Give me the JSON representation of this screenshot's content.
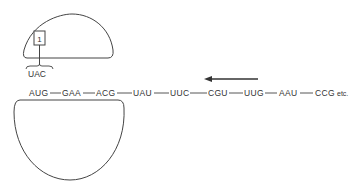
{
  "diagram": {
    "type": "ribosome-translation-schematic",
    "mrna": {
      "codons": [
        "AUG",
        "GAA",
        "ACG",
        "UAU",
        "UUC",
        "CGU",
        "UUG",
        "AAU",
        "CCG"
      ],
      "suffix": "etc."
    },
    "trna": {
      "number_label": "1",
      "anticodon": "UAC"
    },
    "arrow": {
      "direction": "left"
    },
    "colors": {
      "line": "#444444",
      "text": "#333333",
      "background": "#ffffff"
    }
  }
}
